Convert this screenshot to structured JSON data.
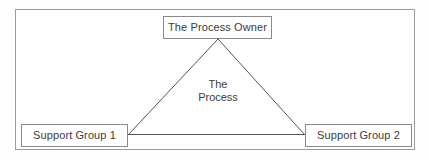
{
  "diagram": {
    "colors": {
      "background": "#ffffff",
      "frame_border": "#9a9a9a",
      "node_border": "#8a8a8a",
      "connector_line": "#555555",
      "text": "#3c3c3c"
    },
    "nodes": [
      {
        "id": "process-owner",
        "label": "The Process Owner",
        "position": "top"
      },
      {
        "id": "support-group-1",
        "label": "Support Group 1",
        "position": "bottom-left"
      },
      {
        "id": "support-group-2",
        "label": "Support Group 2",
        "position": "bottom-right"
      }
    ],
    "center_label": {
      "line_1": "The",
      "line_2": "Process"
    },
    "connectors": [
      {
        "id": "owner-to-group-1",
        "from": "process-owner",
        "to": "support-group-1"
      },
      {
        "id": "owner-to-group-2",
        "from": "process-owner",
        "to": "support-group-2"
      },
      {
        "id": "group-1-to-group-2",
        "from": "support-group-1",
        "to": "support-group-2"
      }
    ]
  }
}
